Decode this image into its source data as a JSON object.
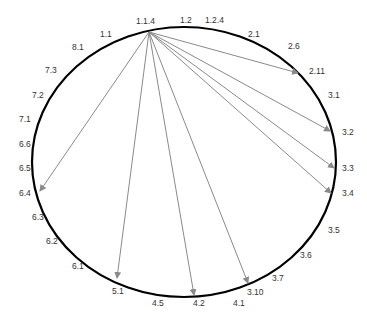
{
  "diagram": {
    "type": "circular-graph",
    "ring": {
      "cx": 184,
      "cy": 162,
      "rx": 152,
      "ry": 135,
      "color": "#000000"
    },
    "edge_color": "#8a8a8a",
    "source": {
      "label": "1.1.4",
      "x": 149,
      "y": 32
    },
    "labels": [
      {
        "text": "1.1.4",
        "x": 136,
        "y": 24
      },
      {
        "text": "1.2",
        "x": 180,
        "y": 23
      },
      {
        "text": "1.2.4",
        "x": 205,
        "y": 23
      },
      {
        "text": "2.1",
        "x": 248,
        "y": 37
      },
      {
        "text": "2.6",
        "x": 288,
        "y": 49
      },
      {
        "text": "2.11",
        "x": 309,
        "y": 74
      },
      {
        "text": "3.1",
        "x": 328,
        "y": 98
      },
      {
        "text": "3.2",
        "x": 342,
        "y": 135
      },
      {
        "text": "3.3",
        "x": 342,
        "y": 171
      },
      {
        "text": "3.4",
        "x": 342,
        "y": 196
      },
      {
        "text": "3.5",
        "x": 328,
        "y": 233
      },
      {
        "text": "3.6",
        "x": 300,
        "y": 258
      },
      {
        "text": "3.7",
        "x": 272,
        "y": 281
      },
      {
        "text": "3.10",
        "x": 247,
        "y": 295
      },
      {
        "text": "4.1",
        "x": 233,
        "y": 306
      },
      {
        "text": "4.2",
        "x": 193,
        "y": 306
      },
      {
        "text": "4.5",
        "x": 152,
        "y": 306
      },
      {
        "text": "5.1",
        "x": 112,
        "y": 294
      },
      {
        "text": "6.1",
        "x": 72,
        "y": 269
      },
      {
        "text": "6.2",
        "x": 46,
        "y": 244
      },
      {
        "text": "6.3",
        "x": 32,
        "y": 220
      },
      {
        "text": "6.4",
        "x": 19,
        "y": 196
      },
      {
        "text": "6.5",
        "x": 19,
        "y": 171
      },
      {
        "text": "6.6",
        "x": 19,
        "y": 147
      },
      {
        "text": "7.1",
        "x": 19,
        "y": 122
      },
      {
        "text": "7.2",
        "x": 32,
        "y": 98
      },
      {
        "text": "7.3",
        "x": 45,
        "y": 73
      },
      {
        "text": "8.1",
        "x": 72,
        "y": 50
      },
      {
        "text": "1.1",
        "x": 100,
        "y": 37
      }
    ],
    "edges": [
      {
        "from": "1.1.4",
        "to": "2.11",
        "x2": 298,
        "y2": 73
      },
      {
        "from": "1.1.4",
        "to": "3.2",
        "x2": 330,
        "y2": 131
      },
      {
        "from": "1.1.4",
        "to": "3.3",
        "x2": 334,
        "y2": 168
      },
      {
        "from": "1.1.4",
        "to": "3.4",
        "x2": 331,
        "y2": 193
      },
      {
        "from": "1.1.4",
        "to": "3.10",
        "x2": 248,
        "y2": 283
      },
      {
        "from": "1.1.4",
        "to": "4.2",
        "x2": 194,
        "y2": 295
      },
      {
        "from": "1.1.4",
        "to": "5.1",
        "x2": 117,
        "y2": 278
      },
      {
        "from": "1.1.4",
        "to": "6.4",
        "x2": 40,
        "y2": 191
      }
    ]
  }
}
